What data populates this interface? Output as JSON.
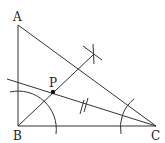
{
  "diagram": {
    "title": "",
    "points": {
      "A": {
        "label": "A",
        "x": 18,
        "y": 25
      },
      "B": {
        "label": "B",
        "x": 18,
        "y": 126
      },
      "C": {
        "label": "C",
        "x": 156,
        "y": 126
      },
      "P": {
        "label": "P",
        "x": 53,
        "y": 92
      }
    },
    "colors": {
      "line": "#333333",
      "point": "#111111"
    }
  }
}
